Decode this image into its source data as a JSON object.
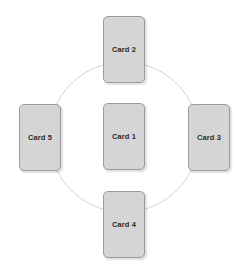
{
  "diagram": {
    "canvas": {
      "width": 247,
      "height": 273,
      "background": "#ffffff"
    },
    "orbit": {
      "shape": "circle",
      "center_x": 124,
      "center_y": 137,
      "radius": 75,
      "stroke_color": "#d2d2d2",
      "stroke_width": 1,
      "fill": "none"
    },
    "card_style": {
      "fill": "#d5d5d5",
      "border_color": "#9b9b9b",
      "text_color": "#2b2b2b",
      "corner_radius": 5,
      "width": 42,
      "height": 67
    },
    "cards": [
      {
        "id": "card-1",
        "label": "Card 1",
        "position": "center",
        "x": 103,
        "y": 103
      },
      {
        "id": "card-2",
        "label": "Card 2",
        "position": "top",
        "x": 103,
        "y": 16
      },
      {
        "id": "card-3",
        "label": "Card 3",
        "position": "right",
        "x": 188,
        "y": 104
      },
      {
        "id": "card-4",
        "label": "Card 4",
        "position": "bottom",
        "x": 103,
        "y": 191
      },
      {
        "id": "card-5",
        "label": "Card 5",
        "position": "left",
        "x": 19,
        "y": 104
      }
    ]
  }
}
